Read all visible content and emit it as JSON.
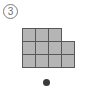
{
  "page": {
    "background_color": "#ffffff",
    "width": 89,
    "height": 90
  },
  "badge": {
    "label": "3",
    "shape": "circle",
    "color": "#6e6e6e",
    "border_color": "#7a7a7a"
  },
  "figure": {
    "name": "polyomino-grid",
    "cell_fill": "#b5b5b5",
    "cell_border": "#585858",
    "cell_size": 14,
    "columns": 4,
    "rows": 3,
    "cell_count": 11,
    "cells": [
      {
        "row": 0,
        "col": 0
      },
      {
        "row": 0,
        "col": 1
      },
      {
        "row": 0,
        "col": 2
      },
      {
        "row": 1,
        "col": 0
      },
      {
        "row": 1,
        "col": 1
      },
      {
        "row": 1,
        "col": 2
      },
      {
        "row": 1,
        "col": 3
      },
      {
        "row": 2,
        "col": 0
      },
      {
        "row": 2,
        "col": 1
      },
      {
        "row": 2,
        "col": 2
      },
      {
        "row": 2,
        "col": 3
      }
    ]
  },
  "marker": {
    "name": "dot",
    "color": "#3b3b3b",
    "diameter": 7
  }
}
